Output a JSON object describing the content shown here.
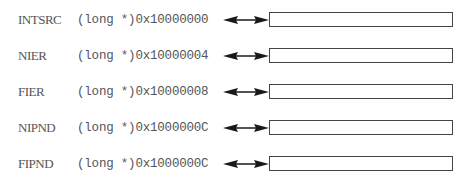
{
  "diagram": {
    "registers": [
      {
        "name": "INTSRC",
        "address": "(long *)0x10000000"
      },
      {
        "name": "NIER",
        "address": "(long *)0x10000004"
      },
      {
        "name": "FIER",
        "address": "(long *)0x10000008"
      },
      {
        "name": "NIPND",
        "address": "(long *)0x1000000C"
      },
      {
        "name": "FIPND",
        "address": "(long *)0x1000000C"
      }
    ],
    "connector_icon": "double-headed-arrow",
    "colors": {
      "text": "#555555",
      "arrow": "#1a1a1a",
      "box_border": "#444444"
    }
  }
}
